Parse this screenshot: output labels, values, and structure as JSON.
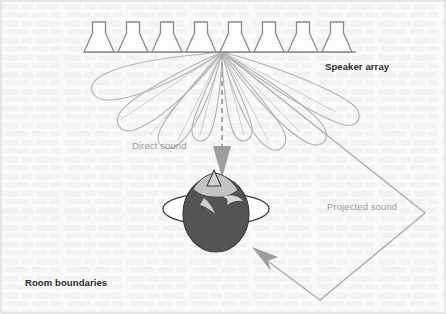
{
  "figure": {
    "width": 446,
    "height": 314,
    "background_color": "#fafafa",
    "paper_texture_color": "#f0f0f0"
  },
  "labels": {
    "speaker_array": "Speaker array",
    "direct_sound": "Direct sound",
    "projected_sound": "Projected sound",
    "room_boundaries": "Room boundaries"
  },
  "colors": {
    "label_dark": "#2b2b2b",
    "label_gray": "#9a9a9a",
    "speaker_outline": "#8c8c8c",
    "speaker_fill": "#fcfcfc",
    "baseline": "#8a8a8a",
    "lobe_stroke": "#b4b4b4",
    "ray_stroke": "#bdbdbd",
    "arrow_gray": "#9e9e9e",
    "room_stroke": "#b0b0b0",
    "head_hair": "#545454",
    "head_face": "#b9b9b9",
    "shoulders_fill": "#ffffff",
    "shoulders_outline": "#4a4a4a"
  },
  "speaker_array": {
    "count": 8,
    "baseline_y": 52,
    "baseline_x_start": 85,
    "baseline_x_end": 356,
    "positions_x": [
      99,
      133,
      167,
      201,
      235,
      269,
      303,
      337
    ],
    "neck_width": 13,
    "horn_width": 30,
    "top_y": 22,
    "neck_bottom_y": 33
  },
  "radiation_lobes": {
    "origin": {
      "x": 222,
      "y": 52
    },
    "description": "Teardrop-shaped directivity lobes radiating from array centre",
    "lobes": [
      {
        "id": "lobe-far-left",
        "angle_deg": 252,
        "length": 112,
        "width": 20
      },
      {
        "id": "lobe-left-2",
        "angle_deg": 236,
        "length": 104,
        "width": 22
      },
      {
        "id": "lobe-left-3",
        "angle_deg": 220,
        "length": 90,
        "width": 22
      },
      {
        "id": "lobe-left-4",
        "angle_deg": 203,
        "length": 74,
        "width": 20
      },
      {
        "id": "lobe-right-4",
        "angle_deg": 157,
        "length": 74,
        "width": 20
      },
      {
        "id": "lobe-right-3",
        "angle_deg": 140,
        "length": 92,
        "width": 22
      },
      {
        "id": "lobe-right-2",
        "angle_deg": 124,
        "length": 112,
        "width": 24
      },
      {
        "id": "lobe-far-right",
        "angle_deg": 108,
        "length": 135,
        "width": 26
      }
    ]
  },
  "direct_sound_arrow": {
    "from": {
      "x": 222,
      "y": 52
    },
    "to": {
      "x": 222,
      "y": 178
    },
    "style": "dashed vertical line with solid triangular arrowhead",
    "arrowhead_width": 17,
    "arrowhead_height": 32,
    "dash_pattern": "5 4"
  },
  "projected_sound_path": {
    "description": "Bent reflected path: array centre to lower-right room corner, then back up-left to listener",
    "points": [
      {
        "x": 222,
        "y": 52
      },
      {
        "x": 425,
        "y": 213
      },
      {
        "x": 320,
        "y": 300
      },
      {
        "x": 258,
        "y": 253
      }
    ],
    "arrowhead_at": {
      "x": 258,
      "y": 253
    },
    "arrowhead_direction_deg": 215
  },
  "listener": {
    "label": "listener head viewed from above",
    "head_center": {
      "x": 216,
      "y": 214
    },
    "head_rx": 33,
    "head_ry": 38,
    "shoulders_center": {
      "x": 216,
      "y": 207
    },
    "shoulders_rx": 53,
    "shoulders_ry": 16,
    "nose_tip": {
      "x": 214,
      "y": 172
    }
  },
  "room_boundaries": {
    "description": "Outer page frame representing room boundary",
    "frame_inset": 1
  }
}
